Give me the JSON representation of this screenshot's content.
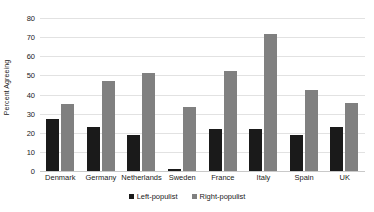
{
  "chart_data": {
    "type": "bar",
    "title": "",
    "xlabel": "",
    "ylabel": "Percent Agreeing",
    "ylim": [
      0,
      80
    ],
    "ytick_step": 10,
    "yticks": [
      0,
      10,
      20,
      30,
      40,
      50,
      60,
      70,
      80
    ],
    "grid": true,
    "legend_position": "bottom-center",
    "categories": [
      "Denmark",
      "Germany",
      "Netherlands",
      "Sweden",
      "France",
      "Italy",
      "Spain",
      "UK"
    ],
    "series": [
      {
        "name": "Left-populist",
        "color": "#1a1a1a",
        "values": [
          27,
          23,
          19,
          1,
          22,
          22,
          19,
          23
        ]
      },
      {
        "name": "Right-populist",
        "color": "#808080",
        "values": [
          35,
          47,
          51,
          33.5,
          52.5,
          71.5,
          42.5,
          35.5
        ]
      }
    ]
  },
  "legend": {
    "items": [
      {
        "label": "Left-populist"
      },
      {
        "label": "Right-populist"
      }
    ]
  }
}
